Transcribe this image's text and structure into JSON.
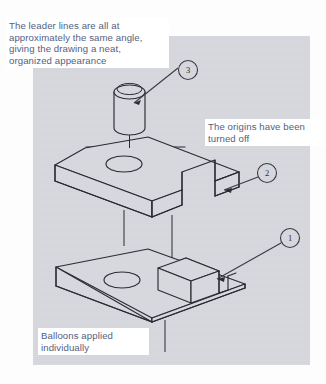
{
  "figure": {
    "type": "exploded-isometric-assembly-drawing",
    "background_color": "#ffffff",
    "panel_color": "#d7d7de",
    "note_text_color": "#53617f",
    "line_color": "#2b2b33"
  },
  "notes": [
    {
      "name": "leader-lines-note",
      "text": "The leader lines are all at approximately the same angle, giving the drawing a neat, organized appearance"
    },
    {
      "name": "origins-note",
      "text": "The origins have been turned off"
    },
    {
      "name": "balloons-note",
      "text": "Balloons applied individually"
    }
  ],
  "balloons": [
    {
      "name": "balloon-3",
      "label": "3",
      "points_to": "cylinder-pin"
    },
    {
      "name": "balloon-2",
      "label": "2",
      "points_to": "slotted-plate"
    },
    {
      "name": "balloon-1",
      "label": "1",
      "points_to": "base-block"
    }
  ],
  "parts": [
    {
      "name": "cylinder-pin",
      "item_number": "3",
      "description": "cylindrical pin with circular top face"
    },
    {
      "name": "slotted-plate",
      "item_number": "2",
      "description": "rectangular plate with through hole and rectangular notch"
    },
    {
      "name": "base-block",
      "item_number": "1",
      "description": "base block with raised rectangular boss and through hole"
    }
  ]
}
